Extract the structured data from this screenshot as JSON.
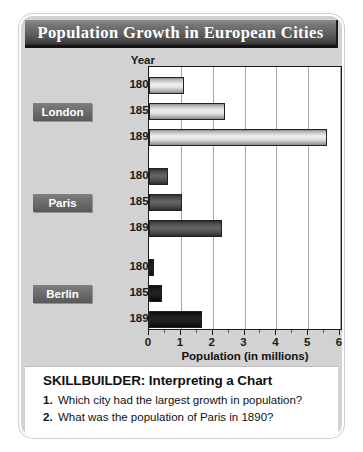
{
  "title": "Population Growth in European Cities",
  "year_header": "Year",
  "axis_title": "Population (in millions)",
  "skillbuilder": {
    "heading": "SKILLBUILDER: Interpreting a Chart",
    "questions": [
      {
        "num": "1.",
        "text": "Which city had the largest growth in population?"
      },
      {
        "num": "2.",
        "text": "What was the population of Paris in 1890?"
      }
    ]
  },
  "colors": {
    "london_bar": "#e2e2e2",
    "paris_bar": "#545454",
    "berlin_bar": "#161616",
    "title_bar": "#4a4a4a",
    "card_bg": "#d2d2d2",
    "plot_bg": "#ffffff",
    "gridline": "#a8a8a8"
  },
  "chart_data": {
    "type": "bar",
    "orientation": "horizontal",
    "title": "Population Growth in European Cities",
    "xlabel": "Population (in millions)",
    "ylabel": "Year",
    "xlim": [
      0,
      6
    ],
    "xticks": [
      0,
      1,
      2,
      3,
      4,
      5,
      6
    ],
    "xticklabels": [
      "0",
      "1",
      "2",
      "3",
      "4",
      "5",
      "6"
    ],
    "grid": true,
    "legend": "none",
    "groups": [
      {
        "name": "London",
        "categories": [
          "1800",
          "1850",
          "1890"
        ],
        "values": [
          1.1,
          2.4,
          5.6
        ]
      },
      {
        "name": "Paris",
        "categories": [
          "1800",
          "1850",
          "1890"
        ],
        "values": [
          0.6,
          1.05,
          2.3
        ]
      },
      {
        "name": "Berlin",
        "categories": [
          "1800",
          "1850",
          "1890"
        ],
        "values": [
          0.17,
          0.4,
          1.65
        ]
      }
    ]
  }
}
